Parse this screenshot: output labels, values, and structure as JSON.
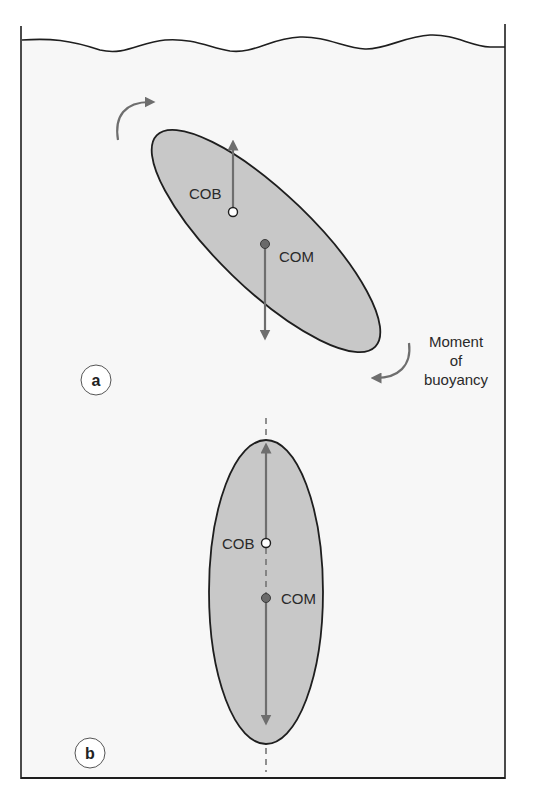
{
  "diagram": {
    "title": "",
    "colors": {
      "water_background": "#f7f7f7",
      "body_fill": "#c8c8c8",
      "outline": "#1e1e1e",
      "arrow": "#6e6e6e",
      "com_point": "#6a6a6a",
      "cob_point": "#ffffff"
    },
    "panels": [
      {
        "id": "a",
        "label": "a",
        "description": "Tilted body: center of buoyancy above-left of center of mass creates a restoring moment",
        "points": {
          "cob_label": "COB",
          "com_label": "COM"
        },
        "annotation": {
          "line1": "Moment",
          "line2": "of",
          "line3": "buoyancy"
        }
      },
      {
        "id": "b",
        "label": "b",
        "description": "Upright body: COB vertically above COM, aligned on dashed vertical axis",
        "points": {
          "cob_label": "COB",
          "com_label": "COM"
        }
      }
    ]
  }
}
